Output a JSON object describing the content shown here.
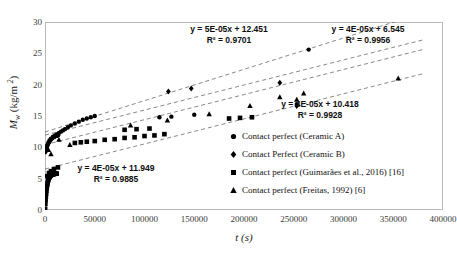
{
  "chart_data": {
    "type": "scatter",
    "title": "",
    "xlabel": "t (s)",
    "ylabel": "M_w (kg/m 2)",
    "xlim": [
      0,
      400000
    ],
    "ylim": [
      0,
      30
    ],
    "grid": false,
    "legend_position": "inside-right",
    "xticks": [
      "0",
      "50000",
      "100000",
      "150000",
      "200000",
      "250000",
      "300000",
      "350000",
      "400000"
    ],
    "yticks": [
      "0",
      "5",
      "10",
      "15",
      "20",
      "25",
      "30"
    ],
    "series": [
      {
        "name": "Contact perfect (Ceramic A)",
        "marker": "circle",
        "trendline": {
          "equation": "y = 5E-05x + 12.451",
          "r2": "R² = 0.9701",
          "slope": 5e-05,
          "intercept": 12.451
        },
        "points": [
          [
            800,
            9.6
          ],
          [
            1500,
            10.0
          ],
          [
            2500,
            10.4
          ],
          [
            3500,
            10.8
          ],
          [
            4500,
            11.1
          ],
          [
            6000,
            11.4
          ],
          [
            8000,
            11.7
          ],
          [
            10000,
            11.9
          ],
          [
            12000,
            12.1
          ],
          [
            14000,
            12.3
          ],
          [
            16000,
            12.5
          ],
          [
            18000,
            12.7
          ],
          [
            20000,
            12.9
          ],
          [
            23000,
            13.2
          ],
          [
            26000,
            13.5
          ],
          [
            30000,
            13.8
          ],
          [
            34000,
            14.1
          ],
          [
            38000,
            14.4
          ],
          [
            42000,
            14.6
          ],
          [
            46000,
            14.8
          ],
          [
            50000,
            15.0
          ],
          [
            115000,
            14.8
          ],
          [
            127000,
            14.9
          ],
          [
            150000,
            15.2
          ],
          [
            253000,
            16.9
          ],
          [
            265000,
            25.6
          ]
        ]
      },
      {
        "name": "Contact Perfect (Ceramic B)",
        "marker": "diamond",
        "trendline": {
          "equation": "y = 4E-05x + 10.418",
          "r2": "R² = 0.9928",
          "slope": 4e-05,
          "intercept": 10.418
        },
        "points": [
          [
            124000,
            18.9
          ],
          [
            147000,
            19.4
          ],
          [
            236000,
            20.3
          ],
          [
            253000,
            16.6
          ]
        ]
      },
      {
        "name": "Contact perfect (Guimarães et al., 2016) [16]",
        "marker": "square",
        "trendline": {
          "equation": "y = 4E-05x + 11.949",
          "r2": "R² = 0.9885",
          "slope": 4e-05,
          "intercept": 11.949
        },
        "points": [
          [
            2000,
            5.4
          ],
          [
            4000,
            5.9
          ],
          [
            6000,
            6.2
          ],
          [
            9000,
            6.5
          ],
          [
            13000,
            6.8
          ],
          [
            30000,
            10.7
          ],
          [
            36000,
            10.8
          ],
          [
            42000,
            10.9
          ],
          [
            50000,
            11.0
          ],
          [
            60000,
            11.2
          ],
          [
            70000,
            11.3
          ],
          [
            80000,
            11.5
          ],
          [
            90000,
            11.6
          ],
          [
            100000,
            11.8
          ],
          [
            110000,
            11.9
          ],
          [
            120000,
            12.1
          ],
          [
            80000,
            12.8
          ],
          [
            92000,
            12.9
          ],
          [
            105000,
            13.0
          ],
          [
            185000,
            14.6
          ],
          [
            196000,
            14.7
          ],
          [
            208000,
            14.8
          ]
        ]
      },
      {
        "name": "Contact perfect (Freitas, 1992) [6]",
        "marker": "triangle",
        "trendline": {
          "equation": "y = 4E-05x + 6.545",
          "r2": "R² = 0.9956",
          "slope": 4e-05,
          "intercept": 6.545
        },
        "points": [
          [
            3500,
            9.6
          ],
          [
            6000,
            8.9
          ],
          [
            14000,
            11.2
          ],
          [
            25000,
            10.4
          ],
          [
            86000,
            13.5
          ],
          [
            123000,
            14.3
          ],
          [
            165000,
            15.3
          ],
          [
            206000,
            16.6
          ],
          [
            236000,
            18.0
          ],
          [
            253000,
            17.6
          ],
          [
            260000,
            18.6
          ],
          [
            355000,
            21.0
          ]
        ]
      }
    ],
    "annotations": [
      {
        "id": "eq-ceramic-a",
        "equation": "y = 5E-05x + 12.451",
        "r2": "R² = 0.9701"
      },
      {
        "id": "eq-freitas",
        "equation": "y = 4E-05x + 6.545",
        "r2": "R² = 0.9956"
      },
      {
        "id": "eq-ceramic-b",
        "equation": "y = 4E-05x + 10.418",
        "r2": "R² = 0.9928"
      },
      {
        "id": "eq-guimaraes",
        "equation": "y = 4E-05x + 11.949",
        "r2": "R² = 0.9885"
      }
    ]
  },
  "axes": {
    "y_label_symbol": "M",
    "y_label_sub": "w",
    "y_label_unit_open": " (kg/m ",
    "y_label_unit_sup": "2",
    "y_label_unit_close": ")",
    "x_label": "t (s)"
  },
  "legend": {
    "items": [
      {
        "label": "Contact perfect (Ceramic A)",
        "marker": "circle-marker"
      },
      {
        "label": "Contact Perfect (Ceramic B)",
        "marker": "diamond-marker"
      },
      {
        "label": "Contact perfect (Guimarães et al., 2016) [16]",
        "marker": "square-marker"
      },
      {
        "label": "Contact perfect (Freitas, 1992) [6]",
        "marker": "triangle-marker"
      }
    ]
  },
  "colors": {
    "marker": "#000000",
    "frame": "#b9b9b9",
    "text": "#1a1a1a",
    "trendline": "#555555",
    "background": "#ffffff"
  }
}
